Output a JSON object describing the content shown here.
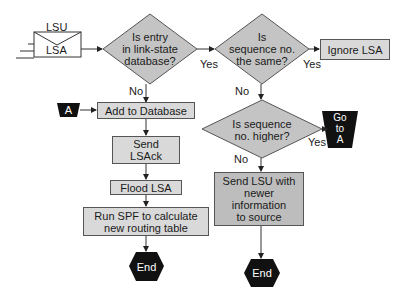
{
  "diagram": {
    "type": "flowchart",
    "colors": {
      "box": "#d9d9d9",
      "box_dark": "#bdbdbd",
      "diamond": "#c4c4c4",
      "terminal": "#111111",
      "line": "#333333"
    },
    "input": {
      "envelope_top": "LSU",
      "envelope_body": "LSA"
    },
    "decisions": {
      "d1": "Is entry in link-state database?",
      "d1_lines": [
        "Is entry",
        "in link-state",
        "database?"
      ],
      "d2_lines": [
        "Is",
        "sequence no.",
        "the same?"
      ],
      "d3_lines": [
        "Is sequence",
        "no. higher?"
      ]
    },
    "processes": {
      "ignore": "Ignore LSA",
      "add": "Add to Database",
      "send_ack_lines": [
        "Send",
        "LSAck"
      ],
      "flood": "Flood LSA",
      "spf_lines": [
        "Run SPF to calculate",
        "new routing table"
      ],
      "send_lsu_lines": [
        "Send LSU with",
        "newer",
        "information",
        "to source"
      ]
    },
    "connectors": {
      "a_in": "A",
      "goto_lines": [
        "Go",
        "to",
        "A"
      ]
    },
    "terminals": {
      "end1": "End",
      "end2": "End"
    },
    "edge_labels": {
      "d1_yes": "Yes",
      "d1_no": "No",
      "d2_yes": "Yes",
      "d2_no": "No",
      "d3_yes": "Yes",
      "d3_no": "No"
    }
  }
}
